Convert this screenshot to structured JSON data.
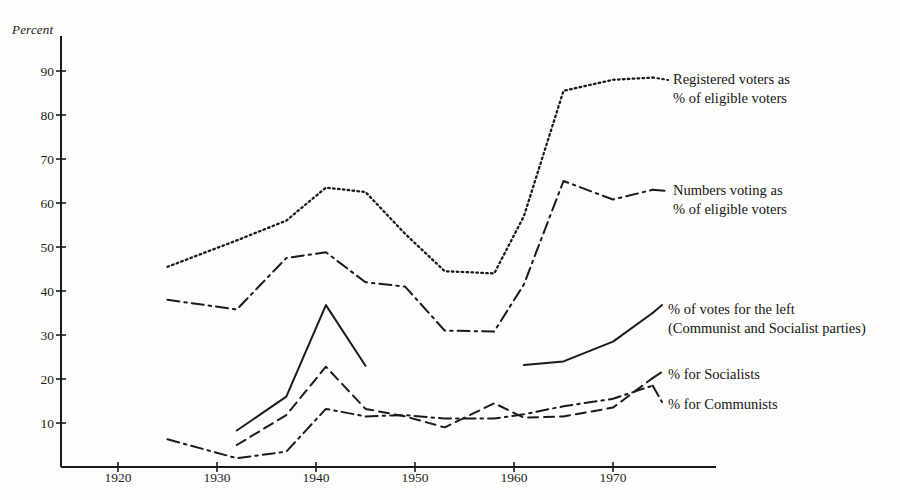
{
  "figure": {
    "axis_title": "Percent",
    "background": "#fdfdfc",
    "ink": "#1a1a1a"
  },
  "chart_data": {
    "type": "line",
    "title": "",
    "xlabel": "",
    "ylabel": "Percent",
    "xlim": [
      1914,
      1978
    ],
    "ylim": [
      0,
      96
    ],
    "grid": false,
    "legend_position": "inline-right",
    "xticks": [
      1920,
      1930,
      1940,
      1950,
      1960,
      1970
    ],
    "yticks": [
      10,
      20,
      30,
      40,
      50,
      60,
      70,
      80,
      90
    ],
    "series": [
      {
        "name": "Registered voters as % of eligible voters",
        "label_line1": "Registered voters as",
        "label_line2": "% of eligible voters",
        "style": "dotted",
        "x": [
          1925,
          1932,
          1937,
          1941,
          1945,
          1949,
          1953,
          1958,
          1961,
          1965,
          1970,
          1974
        ],
        "values": [
          45.5,
          51.5,
          56.0,
          63.5,
          62.5,
          53.0,
          44.5,
          44.0,
          57.0,
          85.5,
          88.0,
          88.5
        ]
      },
      {
        "name": "Numbers voting as % of eligible voters",
        "label_line1": "Numbers voting as",
        "label_line2": "% of eligible voters",
        "style": "dashdot",
        "x": [
          1925,
          1932,
          1937,
          1941,
          1945,
          1949,
          1953,
          1958,
          1961,
          1965,
          1970,
          1974
        ],
        "values": [
          38.0,
          35.8,
          47.5,
          48.8,
          42.0,
          41.0,
          31.0,
          30.8,
          41.5,
          65.0,
          60.8,
          63.0
        ]
      },
      {
        "name": "% of votes for the left (Communist and Socialist parties)",
        "label_line1": "% of votes for the left",
        "label_line2": "(Communist and Socialist parties)",
        "style": "solid",
        "segments": [
          {
            "x": [
              1932,
              1937,
              1941,
              1945
            ],
            "values": [
              8.3,
              16.0,
              36.8,
              23.0
            ]
          },
          {
            "x": [
              1961,
              1965,
              1970,
              1974
            ],
            "values": [
              23.2,
              24.0,
              28.5,
              35.0
            ]
          }
        ]
      },
      {
        "name": "% for Socialists",
        "label_line1": "% for Socialists",
        "style": "dashed",
        "x": [
          1932,
          1937,
          1941,
          1945,
          1949,
          1953,
          1958,
          1961,
          1965,
          1970,
          1974
        ],
        "values": [
          5.0,
          11.8,
          22.8,
          13.2,
          11.5,
          9.0,
          14.5,
          11.2,
          11.5,
          13.5,
          20.2
        ]
      },
      {
        "name": "% for Communists",
        "label_line1": "% for Communists",
        "style": "dashdot",
        "x": [
          1925,
          1932,
          1937,
          1941,
          1945,
          1949,
          1953,
          1958,
          1961,
          1965,
          1970,
          1974
        ],
        "values": [
          6.3,
          2.0,
          3.5,
          13.2,
          11.5,
          11.8,
          11.0,
          11.0,
          12.0,
          13.8,
          15.5,
          18.5
        ]
      }
    ]
  },
  "y_axis": {
    "ticks": [
      "10",
      "20",
      "30",
      "40",
      "50",
      "60",
      "70",
      "80",
      "90"
    ]
  },
  "x_axis": {
    "ticks": [
      "1920",
      "1930",
      "1940",
      "1950",
      "1960",
      "1970"
    ]
  },
  "labels": {
    "registered_l1": "Registered voters as",
    "registered_l2": "% of eligible voters",
    "voting_l1": "Numbers voting as",
    "voting_l2": "% of eligible voters",
    "left_l1": "% of votes for the left",
    "left_l2": "(Communist and Socialist parties)",
    "socialists": "% for Socialists",
    "communists": "% for Communists"
  }
}
